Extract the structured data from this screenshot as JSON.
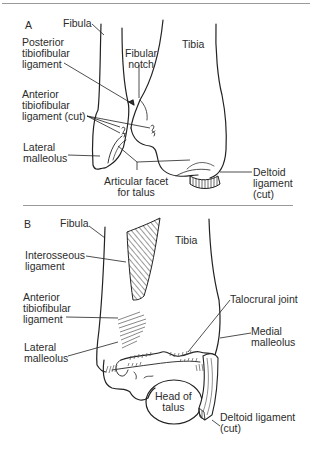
{
  "figure": {
    "panels": [
      {
        "letter": "A",
        "labels": {
          "fibula": "Fibula",
          "tibia": "Tibia",
          "posterior_tibiofibular_ligament": "Posterior\ntibiofibular\nligament",
          "fibular_notch": "Fibular\nnotch",
          "anterior_tibiofibular_ligament_cut": "Anterior\ntibiofibular\nligament (cut)",
          "lateral_malleolus": "Lateral\nmalleolus",
          "articular_facet_for_talus": "Articular facet\nfor talus",
          "deltoid_ligament_cut": "Deltoid\nligament\n(cut)"
        }
      },
      {
        "letter": "B",
        "labels": {
          "fibula": "Fibula",
          "tibia": "Tibia",
          "interosseous_ligament": "Interosseous\nligament",
          "anterior_tibiofibular_ligament": "Anterior\ntibiofibular\nligament",
          "talocrural_joint": "Talocrural joint",
          "medial_malleolus": "Medial\nmalleolus",
          "lateral_malleolus": "Lateral\nmalleolus",
          "head_of_talus": "Head of\ntalus",
          "deltoid_ligament_cut": "Deltoid ligament\n(cut)"
        }
      }
    ],
    "colors": {
      "line": "#222222",
      "rule": "#9a9a9a",
      "background": "#ffffff"
    }
  }
}
